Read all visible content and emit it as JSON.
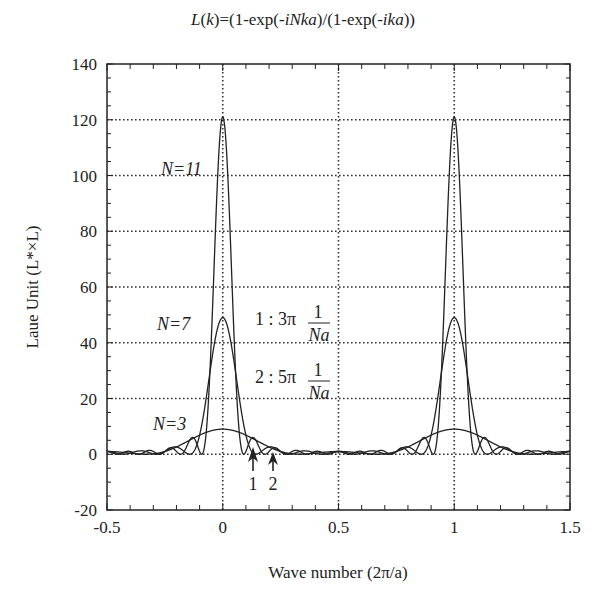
{
  "chart_data": {
    "type": "line",
    "title": "L(k)=(1-exp(-iNka)/(1-exp(-ika))",
    "xlabel": "Wave number (2π/a)",
    "ylabel": "Laue Unit (L*×L)",
    "xlim": [
      -0.5,
      1.5
    ],
    "ylim": [
      -20,
      140
    ],
    "xticks": [
      -0.5,
      0,
      0.5,
      1,
      1.5
    ],
    "xtick_labels": [
      "-0.5",
      "0",
      "0.5",
      "1",
      "1.5"
    ],
    "yticks": [
      -20,
      0,
      20,
      40,
      60,
      80,
      100,
      120,
      140
    ],
    "ytick_labels": [
      "-20",
      "0",
      "20",
      "40",
      "60",
      "80",
      "100",
      "120",
      "140"
    ],
    "grid": true,
    "grid_style": "dotted",
    "function": "|sin(N*pi*k)/sin(pi*k)|^2",
    "series": [
      {
        "name": "N=3",
        "N": 3,
        "peak_value": 9,
        "peak_positions": [
          0,
          1
        ]
      },
      {
        "name": "N=7",
        "N": 7,
        "peak_value": 49,
        "peak_positions": [
          0,
          1
        ]
      },
      {
        "name": "N=11",
        "N": 11,
        "peak_value": 121,
        "peak_positions": [
          0,
          1
        ]
      }
    ],
    "annotations": [
      {
        "text": "N=11",
        "x": -0.23,
        "y": 112
      },
      {
        "text": "N=7",
        "x": -0.2,
        "y": 46
      },
      {
        "text": "N=3",
        "x": -0.2,
        "y": 6
      },
      {
        "text": "1 : 3π 1/(Na)",
        "x": 0.1,
        "y": 48
      },
      {
        "text": "2 : 5π 1/(Na)",
        "x": 0.1,
        "y": 27
      },
      {
        "text": "1",
        "type": "arrow",
        "x": 0.13,
        "y": 0
      },
      {
        "text": "2",
        "type": "arrow",
        "x": 0.22,
        "y": 0
      }
    ]
  },
  "labels": {
    "title_prefix": "L",
    "title_k": "k",
    "title_rest_1": ")=(1-exp(-",
    "title_iNka": "iNka",
    "title_rest_2": ")/(1-exp(-",
    "title_ika": "ika",
    "title_rest_3": "))",
    "n11": "N=11",
    "n7": "N=7",
    "n3": "N=3",
    "ann1": "1 : 3π",
    "ann2": "2 : 5π",
    "frac_num": "1",
    "frac_den": "Na",
    "arrow1": "1",
    "arrow2": "2",
    "xlabel": "Wave number  (2π/a)",
    "ylabel": "Laue Unit  (L*×L)"
  }
}
